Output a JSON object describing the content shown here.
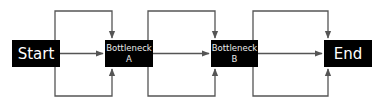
{
  "diagram": {
    "type": "flowchart",
    "nodes": [
      {
        "id": "start",
        "label": "Start"
      },
      {
        "id": "bottleneck_a",
        "label": "Bottleneck",
        "sublabel": "A"
      },
      {
        "id": "bottleneck_b",
        "label": "Bottleneck",
        "sublabel": "B"
      },
      {
        "id": "end",
        "label": "End"
      }
    ],
    "edges": [
      {
        "from": "start",
        "to": "bottleneck_a",
        "route": "direct"
      },
      {
        "from": "start",
        "to": "bottleneck_a",
        "route": "top"
      },
      {
        "from": "start",
        "to": "bottleneck_a",
        "route": "bottom"
      },
      {
        "from": "bottleneck_a",
        "to": "bottleneck_b",
        "route": "direct"
      },
      {
        "from": "bottleneck_a",
        "to": "bottleneck_b",
        "route": "top"
      },
      {
        "from": "bottleneck_a",
        "to": "bottleneck_b",
        "route": "bottom"
      },
      {
        "from": "bottleneck_b",
        "to": "end",
        "route": "direct"
      },
      {
        "from": "bottleneck_b",
        "to": "end",
        "route": "top"
      },
      {
        "from": "bottleneck_b",
        "to": "end",
        "route": "bottom"
      }
    ],
    "colors": {
      "node_fill": "#000000",
      "node_text": "#ffffff",
      "edge": "#555555"
    }
  }
}
